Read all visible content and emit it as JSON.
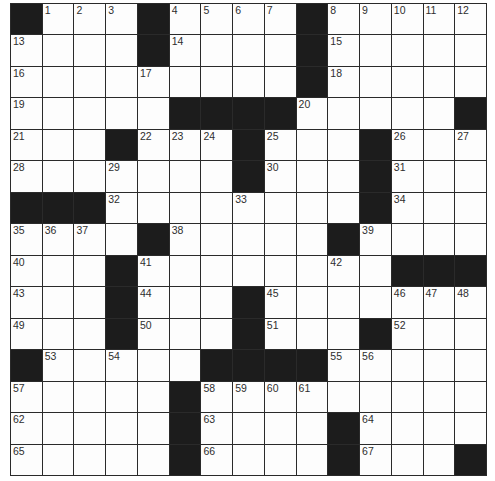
{
  "puzzle": {
    "rows": 15,
    "cols": 15,
    "colors": {
      "black_cell": "#1c1c1c",
      "white_cell": "#fdfdfd",
      "grid_line": "#2a2a2a",
      "number_text": "#2e2e2e"
    },
    "layout": [
      "#...#....#.....",
      "....#....#.....",
      ".........#.....",
      ".....####.....#",
      "...#...#...#...",
      ".......#...#...",
      "###........#...",
      "....#.....#....",
      "...#........###",
      "...#...#.......",
      "...#...#...#...",
      "#.....####.....",
      ".....#.........",
      ".....#....#....",
      ".....#....#...#"
    ],
    "numbers": [
      {
        "r": 0,
        "c": 1,
        "n": "1"
      },
      {
        "r": 0,
        "c": 2,
        "n": "2"
      },
      {
        "r": 0,
        "c": 3,
        "n": "3"
      },
      {
        "r": 0,
        "c": 5,
        "n": "4"
      },
      {
        "r": 0,
        "c": 6,
        "n": "5"
      },
      {
        "r": 0,
        "c": 7,
        "n": "6"
      },
      {
        "r": 0,
        "c": 8,
        "n": "7"
      },
      {
        "r": 0,
        "c": 10,
        "n": "8"
      },
      {
        "r": 0,
        "c": 11,
        "n": "9"
      },
      {
        "r": 0,
        "c": 12,
        "n": "10"
      },
      {
        "r": 0,
        "c": 13,
        "n": "11"
      },
      {
        "r": 0,
        "c": 14,
        "n": "12"
      },
      {
        "r": 1,
        "c": 0,
        "n": "13"
      },
      {
        "r": 1,
        "c": 5,
        "n": "14"
      },
      {
        "r": 1,
        "c": 10,
        "n": "15"
      },
      {
        "r": 2,
        "c": 0,
        "n": "16"
      },
      {
        "r": 2,
        "c": 4,
        "n": "17"
      },
      {
        "r": 2,
        "c": 10,
        "n": "18"
      },
      {
        "r": 3,
        "c": 0,
        "n": "19"
      },
      {
        "r": 3,
        "c": 9,
        "n": "20"
      },
      {
        "r": 4,
        "c": 0,
        "n": "21"
      },
      {
        "r": 4,
        "c": 4,
        "n": "22"
      },
      {
        "r": 4,
        "c": 5,
        "n": "23"
      },
      {
        "r": 4,
        "c": 6,
        "n": "24"
      },
      {
        "r": 4,
        "c": 8,
        "n": "25"
      },
      {
        "r": 4,
        "c": 12,
        "n": "26"
      },
      {
        "r": 4,
        "c": 14,
        "n": "27"
      },
      {
        "r": 5,
        "c": 0,
        "n": "28"
      },
      {
        "r": 5,
        "c": 3,
        "n": "29"
      },
      {
        "r": 5,
        "c": 8,
        "n": "30"
      },
      {
        "r": 5,
        "c": 12,
        "n": "31"
      },
      {
        "r": 6,
        "c": 3,
        "n": "32"
      },
      {
        "r": 6,
        "c": 7,
        "n": "33"
      },
      {
        "r": 6,
        "c": 12,
        "n": "34"
      },
      {
        "r": 7,
        "c": 0,
        "n": "35"
      },
      {
        "r": 7,
        "c": 1,
        "n": "36"
      },
      {
        "r": 7,
        "c": 2,
        "n": "37"
      },
      {
        "r": 7,
        "c": 5,
        "n": "38"
      },
      {
        "r": 7,
        "c": 11,
        "n": "39"
      },
      {
        "r": 8,
        "c": 0,
        "n": "40"
      },
      {
        "r": 8,
        "c": 4,
        "n": "41"
      },
      {
        "r": 8,
        "c": 10,
        "n": "42"
      },
      {
        "r": 9,
        "c": 0,
        "n": "43"
      },
      {
        "r": 9,
        "c": 4,
        "n": "44"
      },
      {
        "r": 9,
        "c": 8,
        "n": "45"
      },
      {
        "r": 9,
        "c": 12,
        "n": "46"
      },
      {
        "r": 9,
        "c": 13,
        "n": "47"
      },
      {
        "r": 9,
        "c": 14,
        "n": "48"
      },
      {
        "r": 10,
        "c": 0,
        "n": "49"
      },
      {
        "r": 10,
        "c": 4,
        "n": "50"
      },
      {
        "r": 10,
        "c": 8,
        "n": "51"
      },
      {
        "r": 10,
        "c": 12,
        "n": "52"
      },
      {
        "r": 11,
        "c": 1,
        "n": "53"
      },
      {
        "r": 11,
        "c": 3,
        "n": "54"
      },
      {
        "r": 11,
        "c": 10,
        "n": "55"
      },
      {
        "r": 11,
        "c": 11,
        "n": "56"
      },
      {
        "r": 12,
        "c": 0,
        "n": "57"
      },
      {
        "r": 12,
        "c": 6,
        "n": "58"
      },
      {
        "r": 12,
        "c": 7,
        "n": "59"
      },
      {
        "r": 12,
        "c": 8,
        "n": "60"
      },
      {
        "r": 12,
        "c": 9,
        "n": "61"
      },
      {
        "r": 13,
        "c": 0,
        "n": "62"
      },
      {
        "r": 13,
        "c": 6,
        "n": "63"
      },
      {
        "r": 13,
        "c": 11,
        "n": "64"
      },
      {
        "r": 14,
        "c": 0,
        "n": "65"
      },
      {
        "r": 14,
        "c": 6,
        "n": "66"
      },
      {
        "r": 14,
        "c": 11,
        "n": "67"
      }
    ]
  }
}
